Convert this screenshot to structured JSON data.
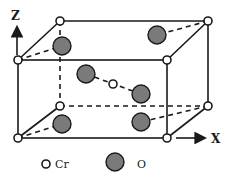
{
  "diagram": {
    "type": "crystal-unit-cell",
    "axes": {
      "z_label": "Z",
      "x_label": "X"
    },
    "legend": [
      {
        "symbol": "small-open-circle",
        "label": "Cr"
      },
      {
        "symbol": "large-gray-circle",
        "label": "O"
      }
    ],
    "colors": {
      "line": "#1a1a1a",
      "cr_fill": "#ffffff",
      "o_fill": "#7a7a7a"
    },
    "atoms": {
      "cr_count_visible": 9,
      "o_count_visible": 6
    }
  }
}
